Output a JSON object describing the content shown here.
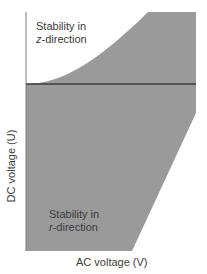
{
  "diagram": {
    "x_axis_label": "AC voltage (V)",
    "y_axis_label": "DC voltage (U)",
    "regions": [
      {
        "line1": "Stability in",
        "axis_letter": "z",
        "line2_suffix": "-direction"
      },
      {
        "line1": "Stability in",
        "axis_letter": "r",
        "line2_suffix": "-direction"
      }
    ],
    "colors": {
      "stable_region_fill": "#9a9a9a",
      "boundary_line": "#3c3c3c",
      "axis_line": "#7a7a7a",
      "background": "#ffffff"
    }
  }
}
